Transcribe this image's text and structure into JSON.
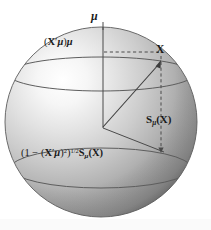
{
  "figure": {
    "background_color": "#ffffff",
    "sphere": {
      "center_x": 101,
      "center_y": 122,
      "radius_x": 96,
      "radius_y": 95,
      "fill_light": "#fdfdfd",
      "fill_mid": "#c9c9c9",
      "fill_dark": "#767676",
      "outline_color": "#5a5a5a",
      "highlight_x": 48,
      "highlight_y": 84
    },
    "axis": {
      "name": "mu-axis",
      "x": 103,
      "top_y": 22,
      "bottom_y": 128,
      "color": "#4a4a4a"
    },
    "vector": {
      "name": "vector-X",
      "from_x": 103,
      "from_y": 127,
      "to_x": 161,
      "to_y": 63,
      "color": "#3c3c3c"
    },
    "ellipses": [
      {
        "name": "upper-latitude-arc",
        "cy": 74,
        "rx": 93,
        "ry": 17
      },
      {
        "name": "lower-latitude-arc",
        "cy": 168,
        "rx": 90,
        "ry": 20
      }
    ],
    "dashed_lines": [
      {
        "name": "dashed-horizontal-to-X",
        "x1": 104,
        "y1": 52,
        "x2": 160,
        "y2": 52
      },
      {
        "name": "dashed-vertical-from-X",
        "x1": 161,
        "y1": 58,
        "x2": 161,
        "y2": 151
      }
    ],
    "solid_lines": [
      {
        "name": "center-to-equator-right",
        "x1": 103,
        "y1": 128,
        "x2": 163,
        "y2": 152
      }
    ]
  },
  "labels": {
    "mu": {
      "name": "mu-label",
      "text": "μ"
    },
    "xprime_mu_mu": {
      "name": "x-prime-mu-times-mu-label",
      "open_paren": "(",
      "x_bold": "X",
      "prime": "′",
      "mu": "μ",
      "close_paren": ")",
      "mu_outer": "μ",
      "plain_text": "(X′μ)μ"
    },
    "x": {
      "name": "x-vector-label",
      "text": "X"
    },
    "s_mu_x": {
      "name": "s-mu-of-x-label",
      "s": "S",
      "mu_sub": "μ",
      "arg": "(X)",
      "plain_text": "Sμ(X)"
    },
    "projection": {
      "name": "scaled-s-mu-of-x-label",
      "lead": "(1 − (",
      "x_bold": "X",
      "prime": "′",
      "mu": "μ",
      "close": ")",
      "square": "2",
      "close2": ")",
      "exponent": "1/2",
      "s": "S",
      "mu_sub": "μ",
      "arg": "(X)",
      "plain_text": "(1 − (X′μ)²)^(1/2) Sμ(X)"
    }
  }
}
